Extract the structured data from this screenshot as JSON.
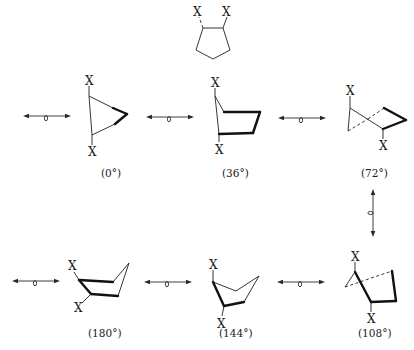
{
  "figure": {
    "substituent_label": "X",
    "colors": {
      "ink": "#1f1f1f",
      "background": "#ffffff"
    }
  },
  "reference_structure": {
    "name": "cyclopentane-1,2-diX",
    "labels": [
      "X",
      "X"
    ]
  },
  "conformers": [
    {
      "id": "c0",
      "angle_label": "(0°)",
      "labels": [
        "X",
        "X"
      ],
      "row": 1,
      "position": "left"
    },
    {
      "id": "c36",
      "angle_label": "(36°)",
      "labels": [
        "X",
        "X"
      ],
      "row": 1,
      "position": "center"
    },
    {
      "id": "c72",
      "angle_label": "(72°)",
      "labels": [
        "X",
        "X"
      ],
      "row": 1,
      "position": "right"
    },
    {
      "id": "c108",
      "angle_label": "(108°)",
      "labels": [
        "X",
        "X"
      ],
      "row": 2,
      "position": "right"
    },
    {
      "id": "c144",
      "angle_label": "(144°)",
      "labels": [
        "X",
        "X"
      ],
      "row": 2,
      "position": "center"
    },
    {
      "id": "c180",
      "angle_label": "(180°)",
      "labels": [
        "X",
        "X"
      ],
      "row": 2,
      "position": "left"
    }
  ],
  "equilibria": {
    "symbol": "double-headed arrow with loop (pseudorotation)",
    "count": 7
  }
}
